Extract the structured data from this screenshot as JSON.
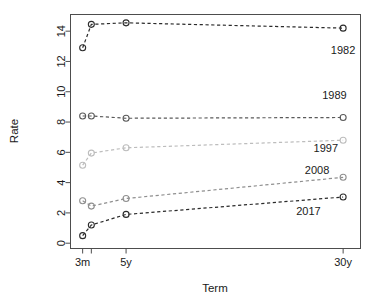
{
  "chart_data": {
    "type": "line",
    "title": "",
    "subtitle": "",
    "xlabel": "Term",
    "ylabel": "Rate",
    "grid": false,
    "legend_position": "inline-annotations",
    "x": [
      "3m",
      "1y",
      "5y",
      "30y"
    ],
    "x_tick_labels": [
      "3m",
      "",
      "5y",
      "30y"
    ],
    "x_tick_values": [
      0,
      1,
      5,
      30
    ],
    "xlim": [
      -1.4,
      32
    ],
    "ylim": [
      -0.35,
      15.1
    ],
    "y_ticks": [
      0,
      2,
      4,
      6,
      8,
      10,
      12,
      14
    ],
    "y_tick_labels": [
      "0",
      "2",
      "4",
      "6",
      "8",
      "10",
      "12",
      "14"
    ],
    "series": [
      {
        "name": "1982",
        "values": [
          12.9,
          14.45,
          14.55,
          14.2
        ],
        "color": "#2b2b2b",
        "label_x": 30,
        "label_y": 12.5
      },
      {
        "name": "1989",
        "values": [
          8.4,
          8.4,
          8.25,
          8.3
        ],
        "color": "#5a5a5a",
        "label_x": 29,
        "label_y": 9.5
      },
      {
        "name": "1997",
        "values": [
          5.15,
          5.95,
          6.3,
          6.8
        ],
        "color": "#bdbdbd",
        "label_x": 28,
        "label_y": 6.0
      },
      {
        "name": "2008",
        "values": [
          2.8,
          2.45,
          2.95,
          4.35
        ],
        "color": "#8f8f8f",
        "label_x": 27,
        "label_y": 4.6
      },
      {
        "name": "2017",
        "values": [
          0.5,
          1.2,
          1.9,
          3.05
        ],
        "color": "#2b2b2b",
        "label_x": 26,
        "label_y": 1.85
      }
    ]
  },
  "axes": {
    "x_title": "Term",
    "y_title": "Rate",
    "x_labels": [
      "3m",
      "5y",
      "30y"
    ],
    "y_labels": [
      "0",
      "2",
      "4",
      "6",
      "8",
      "10",
      "12",
      "14"
    ]
  },
  "annotations": {
    "s1982": "1982",
    "s1989": "1989",
    "s1997": "1997",
    "s2008": "2008",
    "s2017": "2017"
  }
}
